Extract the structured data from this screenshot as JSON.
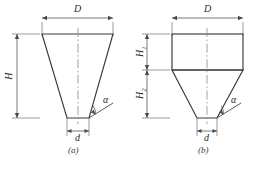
{
  "figure": {
    "caption_a": "(a)",
    "caption_b": "(b)",
    "panels": [
      {
        "id": "a",
        "caption": "(a)",
        "shape": "trapezoid",
        "dimensions": [
          {
            "name": "D",
            "label": "D",
            "orientation": "horizontal",
            "position": "top"
          },
          {
            "name": "H",
            "label": "H",
            "orientation": "vertical",
            "position": "left"
          },
          {
            "name": "d",
            "label": "d",
            "orientation": "horizontal",
            "position": "bottom"
          },
          {
            "name": "alpha",
            "label": "α",
            "orientation": "angle",
            "position": "bottom-right"
          }
        ]
      },
      {
        "id": "b",
        "caption": "(b)",
        "shape": "rectangle-over-trapezoid",
        "dimensions": [
          {
            "name": "D",
            "label": "D",
            "orientation": "horizontal",
            "position": "top"
          },
          {
            "name": "H1",
            "label": "H",
            "sub": "1",
            "orientation": "vertical",
            "position": "left-upper"
          },
          {
            "name": "H2",
            "label": "H",
            "sub": "2",
            "orientation": "vertical",
            "position": "left-lower"
          },
          {
            "name": "d",
            "label": "d",
            "orientation": "horizontal",
            "position": "bottom"
          },
          {
            "name": "alpha",
            "label": "α",
            "orientation": "angle",
            "position": "bottom-right"
          }
        ]
      }
    ],
    "labels": {
      "D_a": "D",
      "H_a": "H",
      "d_a": "d",
      "alpha_a": "α",
      "D_b": "D",
      "H_b_main": "H",
      "H1_sub": "1",
      "H2_sub": "2",
      "d_b": "d",
      "alpha_b": "α"
    },
    "colors": {
      "outline": "#3a3a3a",
      "dimension_line": "#6b6b6b",
      "centerline": "#8a8a8a",
      "background": "#ffffff",
      "text": "#2b2b2b"
    }
  }
}
